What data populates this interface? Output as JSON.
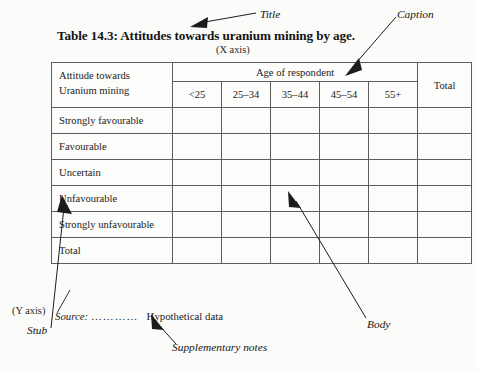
{
  "title": "Table 14.3:  Attitudes towards uranium mining by age.",
  "x_axis_note": "(X axis)",
  "y_axis_note": "(Y axis)",
  "table": {
    "stub_header_line1": "Attitude towards",
    "stub_header_line2": "Uranium mining",
    "spanner_header": "Age of respondent",
    "total_header": "Total",
    "age_columns": [
      "<25",
      "25–34",
      "35–44",
      "45–54",
      "55+"
    ],
    "rows": [
      {
        "label": "Strongly favourable",
        "cells": [
          "",
          "",
          "",
          "",
          "",
          ""
        ]
      },
      {
        "label": "Favourable",
        "cells": [
          "",
          "",
          "",
          "",
          "",
          ""
        ]
      },
      {
        "label": "Uncertain",
        "cells": [
          "",
          "",
          "",
          "",
          "",
          ""
        ]
      },
      {
        "label": "Unfavourable",
        "cells": [
          "",
          "",
          "",
          "",
          "",
          ""
        ]
      },
      {
        "label": "Strongly unfavourable",
        "cells": [
          "",
          "",
          "",
          "",
          "",
          ""
        ]
      },
      {
        "label": "Total",
        "cells": [
          "",
          "",
          "",
          "",
          "",
          ""
        ]
      }
    ]
  },
  "source": {
    "label": "Source:",
    "dots": "…………",
    "value": "Hypothetical data"
  },
  "callouts": {
    "title": "Title",
    "caption": "Caption",
    "body": "Body",
    "stub": "Stub",
    "supplementary_notes": "Supplementary notes"
  },
  "colors": {
    "page_background": "#fbfbf9",
    "table_background": "#fdfdfc",
    "rule": "#5d5d5d",
    "text": "#1a1a1a",
    "arrow": "#1c1c1c"
  }
}
